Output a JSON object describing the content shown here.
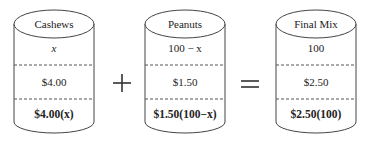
{
  "diagram": {
    "containers": [
      {
        "name": "Cashews",
        "amount": "x",
        "price": "$4.00",
        "value": "$4.00(x)"
      },
      {
        "name": "Peanuts",
        "amount": "100 − x",
        "price": "$1.50",
        "value": "$1.50(100−x)"
      },
      {
        "name": "Final Mix",
        "amount": "100",
        "price": "$2.50",
        "value": "$2.50(100)"
      }
    ],
    "operators": [
      "+",
      "="
    ]
  }
}
